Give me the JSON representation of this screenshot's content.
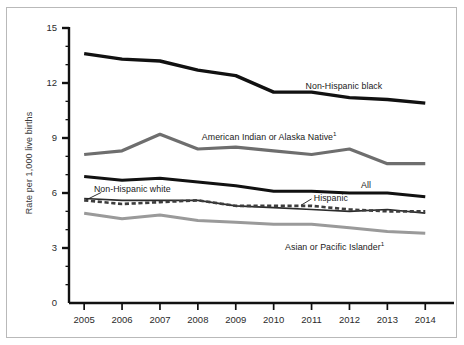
{
  "figure": {
    "border_color": "#b9b9b9",
    "background": "#ffffff"
  },
  "axes": {
    "ylabel": "Rate per 1,000 live births",
    "ytick_labels": [
      "0",
      "3",
      "6",
      "9",
      "12",
      "15"
    ],
    "xtick_labels": [
      "2005",
      "2006",
      "2007",
      "2008",
      "2009",
      "2010",
      "2011",
      "2012",
      "2013",
      "2014"
    ]
  },
  "annotations": {
    "non_hispanic_black": "Non-Hispanic black",
    "american_indian": "American Indian or Alaska Native",
    "american_indian_footnote": "1",
    "non_hispanic_white": "Non-Hispanic white",
    "all": "All",
    "hispanic": "Hispanic",
    "asian_pacific": "Asian or Pacific Islander",
    "asian_pacific_footnote": "1"
  },
  "chart_data": {
    "type": "line",
    "title": "",
    "xlabel": "",
    "ylabel": "Rate per 1,000 live births",
    "x": [
      2005,
      2006,
      2007,
      2008,
      2009,
      2010,
      2011,
      2012,
      2013,
      2014
    ],
    "xlim": [
      2004.6,
      2014.6
    ],
    "ylim": [
      0,
      15
    ],
    "yticks": [
      0,
      3,
      6,
      9,
      12,
      15
    ],
    "yminor_ticks": [
      1,
      2,
      4,
      5,
      7,
      8,
      10,
      11,
      13,
      14
    ],
    "grid": false,
    "legend_position": "inline-annotations",
    "series": [
      {
        "name": "Non-Hispanic black",
        "color": "#111111",
        "linewidth": 3.4,
        "linestyle": "solid",
        "values": [
          13.6,
          13.3,
          13.2,
          12.7,
          12.4,
          11.5,
          11.5,
          11.2,
          11.1,
          10.9
        ]
      },
      {
        "name": "American Indian or Alaska Native",
        "color": "#6e6e6e",
        "linewidth": 3.2,
        "linestyle": "solid",
        "values": [
          8.1,
          8.3,
          9.2,
          8.4,
          8.5,
          8.3,
          8.1,
          8.4,
          7.6,
          7.6
        ]
      },
      {
        "name": "All",
        "color": "#111111",
        "linewidth": 3.0,
        "linestyle": "solid",
        "values": [
          6.9,
          6.7,
          6.8,
          6.6,
          6.4,
          6.1,
          6.1,
          6.0,
          6.0,
          5.8
        ]
      },
      {
        "name": "Non-Hispanic white",
        "color": "#2b2b2b",
        "linewidth": 1.6,
        "linestyle": "solid",
        "values": [
          5.7,
          5.6,
          5.6,
          5.6,
          5.3,
          5.2,
          5.1,
          5.0,
          5.1,
          4.9
        ]
      },
      {
        "name": "Hispanic",
        "color": "#3d3d3d",
        "linewidth": 2.6,
        "linestyle": "dashed",
        "values": [
          5.6,
          5.4,
          5.5,
          5.6,
          5.3,
          5.3,
          5.3,
          5.1,
          5.0,
          5.0
        ]
      },
      {
        "name": "Asian or Pacific Islander",
        "color": "#9a9a9a",
        "linewidth": 3.0,
        "linestyle": "solid",
        "values": [
          4.9,
          4.6,
          4.8,
          4.5,
          4.4,
          4.3,
          4.3,
          4.1,
          3.9,
          3.8
        ]
      }
    ]
  }
}
